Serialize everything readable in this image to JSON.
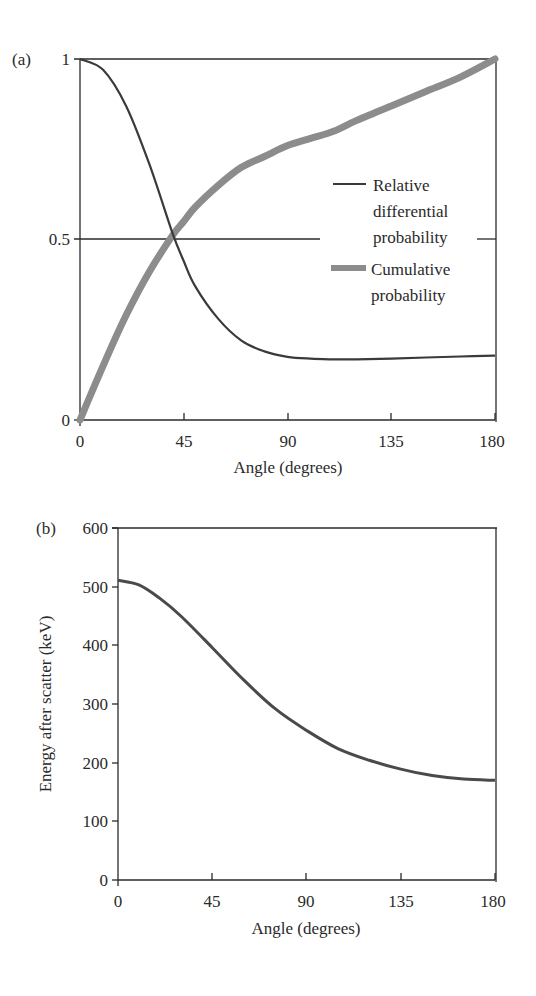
{
  "chart_data": [
    {
      "panel": "(a)",
      "type": "line",
      "title": "",
      "xlabel": "Angle (degrees)",
      "ylabel": "",
      "xlim": [
        0,
        180
      ],
      "ylim": [
        0,
        1
      ],
      "x_ticks": [
        "0",
        "45",
        "90",
        "135",
        "180"
      ],
      "y_ticks": [
        "0",
        "0.5",
        "1"
      ],
      "grid": false,
      "reference_line": {
        "y": 0.5
      },
      "legend_position": "right, mid-height inside plot",
      "x": [
        0,
        10,
        20,
        30,
        40,
        45,
        50,
        60,
        70,
        80,
        90,
        100,
        110,
        120,
        135,
        150,
        165,
        180
      ],
      "series": [
        {
          "name": "Relative differential probability",
          "style": "thin dark line",
          "color": "#3a3a3a",
          "values": [
            1.0,
            0.97,
            0.87,
            0.71,
            0.52,
            0.44,
            0.37,
            0.28,
            0.22,
            0.19,
            0.175,
            0.17,
            0.168,
            0.168,
            0.17,
            0.173,
            0.176,
            0.178
          ]
        },
        {
          "name": "Cumulative probability",
          "style": "thick gray line",
          "color": "#8c8c8c",
          "values": [
            0.0,
            0.15,
            0.29,
            0.41,
            0.51,
            0.55,
            0.59,
            0.65,
            0.7,
            0.73,
            0.76,
            0.78,
            0.8,
            0.83,
            0.87,
            0.91,
            0.95,
            1.0
          ]
        }
      ]
    },
    {
      "panel": "(b)",
      "type": "line",
      "title": "",
      "xlabel": "Angle (degrees)",
      "ylabel": "Energy after scatter (keV)",
      "xlim": [
        0,
        180
      ],
      "ylim": [
        0,
        600
      ],
      "x_ticks": [
        "0",
        "45",
        "90",
        "135",
        "180"
      ],
      "y_ticks": [
        "0",
        "100",
        "200",
        "300",
        "400",
        "500",
        "600"
      ],
      "grid": false,
      "x": [
        0,
        10,
        20,
        30,
        45,
        60,
        75,
        90,
        105,
        120,
        135,
        150,
        165,
        180
      ],
      "series": [
        {
          "name": "Energy after scatter",
          "color": "#4a4a4a",
          "values": [
            511,
            503,
            480,
            450,
            396,
            341,
            292,
            255,
            224,
            204,
            189,
            178,
            172,
            170
          ]
        }
      ]
    }
  ],
  "labels": {
    "panel_a": "(a)",
    "panel_b": "(b)",
    "a_xlabel": "Angle (degrees)",
    "b_xlabel": "Angle (degrees)",
    "b_ylabel": "Energy after scatter (keV)",
    "legend_relative_1": "Relative",
    "legend_relative_2": "differential",
    "legend_relative_3": "probability",
    "legend_cumulative_1": "Cumulative",
    "legend_cumulative_2": "probability"
  }
}
